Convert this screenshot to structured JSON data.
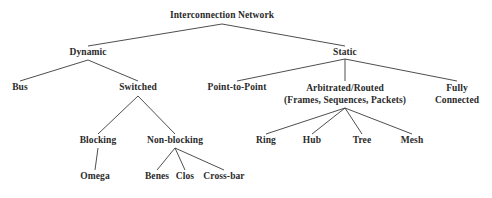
{
  "diagram": {
    "type": "hierarchy-tree",
    "background_color": "#ffffff",
    "text_color": "#2a2a2a",
    "edge_color": "#3a3a3a",
    "nodes": {
      "root": {
        "label": "Interconnection Network",
        "x": 222,
        "y": 16
      },
      "dynamic": {
        "label": "Dynamic",
        "x": 88,
        "y": 53
      },
      "static": {
        "label": "Static",
        "x": 345,
        "y": 53
      },
      "bus": {
        "label": "Bus",
        "x": 20,
        "y": 88
      },
      "switched": {
        "label": "Switched",
        "x": 138,
        "y": 88
      },
      "point_to_point": {
        "label": "Point-to-Point",
        "x": 237,
        "y": 88
      },
      "arbitrated_line1": {
        "label": "Arbitrated/Routed",
        "x": 345,
        "y": 88
      },
      "arbitrated_line2": {
        "label": "(Frames, Sequences, Packets)",
        "x": 345,
        "y": 100
      },
      "fully_line1": {
        "label": "Fully",
        "x": 457,
        "y": 88
      },
      "fully_line2": {
        "label": "Connected",
        "x": 457,
        "y": 100
      },
      "blocking": {
        "label": "Blocking",
        "x": 98,
        "y": 141
      },
      "non_blocking": {
        "label": "Non-blocking",
        "x": 175,
        "y": 141
      },
      "ring": {
        "label": "Ring",
        "x": 266,
        "y": 141
      },
      "hub": {
        "label": "Hub",
        "x": 312,
        "y": 141
      },
      "tree": {
        "label": "Tree",
        "x": 362,
        "y": 141
      },
      "mesh": {
        "label": "Mesh",
        "x": 412,
        "y": 141
      },
      "omega": {
        "label": "Omega",
        "x": 95,
        "y": 177
      },
      "benes": {
        "label": "Benes",
        "x": 157,
        "y": 177
      },
      "clos": {
        "label": "Clos",
        "x": 185,
        "y": 177
      },
      "crossbar": {
        "label": "Cross-bar",
        "x": 224,
        "y": 177
      }
    },
    "edges": [
      {
        "from": "root",
        "to": "dynamic",
        "x1": 222,
        "y1": 24,
        "x2": 88,
        "y2": 46
      },
      {
        "from": "root",
        "to": "static",
        "x1": 222,
        "y1": 24,
        "x2": 345,
        "y2": 46
      },
      {
        "from": "dynamic",
        "to": "bus",
        "x1": 88,
        "y1": 60,
        "x2": 20,
        "y2": 81
      },
      {
        "from": "dynamic",
        "to": "switched",
        "x1": 88,
        "y1": 60,
        "x2": 138,
        "y2": 81
      },
      {
        "from": "static",
        "to": "point_to_point",
        "x1": 345,
        "y1": 59,
        "x2": 237,
        "y2": 81
      },
      {
        "from": "static",
        "to": "arbitrated",
        "x1": 345,
        "y1": 59,
        "x2": 345,
        "y2": 81
      },
      {
        "from": "static",
        "to": "fully_connected",
        "x1": 345,
        "y1": 59,
        "x2": 457,
        "y2": 81
      },
      {
        "from": "switched",
        "to": "blocking",
        "x1": 138,
        "y1": 96,
        "x2": 98,
        "y2": 134
      },
      {
        "from": "switched",
        "to": "non_blocking",
        "x1": 138,
        "y1": 96,
        "x2": 175,
        "y2": 134
      },
      {
        "from": "arbitrated",
        "to": "ring",
        "x1": 345,
        "y1": 108,
        "x2": 266,
        "y2": 134
      },
      {
        "from": "arbitrated",
        "to": "hub",
        "x1": 345,
        "y1": 108,
        "x2": 312,
        "y2": 134
      },
      {
        "from": "arbitrated",
        "to": "tree",
        "x1": 345,
        "y1": 108,
        "x2": 362,
        "y2": 134
      },
      {
        "from": "arbitrated",
        "to": "mesh",
        "x1": 345,
        "y1": 108,
        "x2": 412,
        "y2": 134
      },
      {
        "from": "blocking",
        "to": "omega",
        "x1": 98,
        "y1": 148,
        "x2": 95,
        "y2": 170
      },
      {
        "from": "non_blocking",
        "to": "benes",
        "x1": 175,
        "y1": 148,
        "x2": 157,
        "y2": 170
      },
      {
        "from": "non_blocking",
        "to": "clos",
        "x1": 175,
        "y1": 148,
        "x2": 185,
        "y2": 170
      },
      {
        "from": "non_blocking",
        "to": "crossbar",
        "x1": 175,
        "y1": 148,
        "x2": 224,
        "y2": 170
      }
    ]
  }
}
